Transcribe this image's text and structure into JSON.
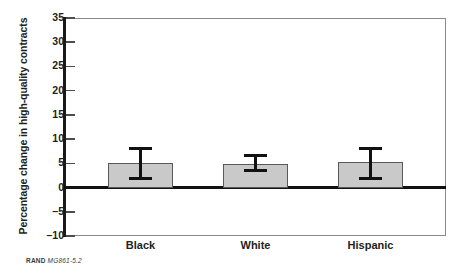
{
  "chart_data": {
    "type": "bar",
    "title": "",
    "xlabel": "",
    "ylabel": "Percentage change in high-quality contracts",
    "categories": [
      "Black",
      "White",
      "Hispanic"
    ],
    "values": [
      5.1,
      4.9,
      5.3
    ],
    "error_bars": {
      "lower": [
        1.5,
        3.2,
        1.5
      ],
      "upper": [
        8.3,
        6.9,
        8.3
      ]
    },
    "ylim": [
      -10,
      35
    ],
    "yticks": [
      -10,
      -5,
      0,
      5,
      10,
      15,
      20,
      25,
      30,
      35
    ],
    "ytick_labels": [
      "–10",
      "–5",
      "0",
      "5",
      "10",
      "15",
      "20",
      "25",
      "30",
      "35"
    ],
    "grid": false,
    "legend": null,
    "zero_line": 0,
    "bar_color": "#c9c9c9",
    "bar_edge_color": "#595959",
    "error_color": "#111111",
    "axis_color": "#1a1a1a"
  },
  "caption": {
    "source": "RAND",
    "figure_number": "MG861-5.2"
  }
}
